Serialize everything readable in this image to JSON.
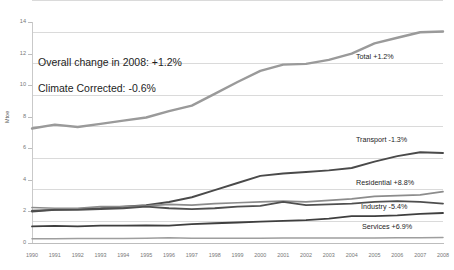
{
  "title_fragment": "g",
  "annotations": [
    {
      "id": "overall-change",
      "text": "Overall change in 2008: +1.2%"
    },
    {
      "id": "climate-corrected",
      "text": "Climate Corrected: -0.6%"
    }
  ],
  "chart_data": {
    "type": "line",
    "title": "",
    "xlabel": "",
    "ylabel": "Mtoe",
    "ylim": [
      0,
      14
    ],
    "yticks": [
      0,
      2,
      4,
      6,
      8,
      10,
      12,
      14
    ],
    "grid": true,
    "legend_position": "right-inline-labels",
    "x": [
      1990,
      1991,
      1992,
      1993,
      1994,
      1995,
      1996,
      1997,
      1998,
      1999,
      2000,
      2001,
      2002,
      2003,
      2004,
      2005,
      2006,
      2007,
      2008
    ],
    "categories": [
      "1990",
      "1991",
      "1992",
      "1993",
      "1994",
      "1995",
      "1996",
      "1997",
      "1998",
      "1999",
      "2000",
      "2001",
      "2002",
      "2003",
      "2004",
      "2005",
      "2006",
      "2007",
      "2008"
    ],
    "series": [
      {
        "name": "Total",
        "label": "Total +1.2%",
        "change": "+1.2%",
        "color": "#9a9a9a",
        "width": 2.4,
        "values": [
          7.25,
          7.5,
          7.35,
          7.55,
          7.75,
          7.95,
          8.35,
          8.7,
          9.45,
          10.2,
          10.9,
          11.3,
          11.35,
          11.6,
          12.0,
          12.65,
          13.0,
          13.35,
          13.4
        ]
      },
      {
        "name": "Transport",
        "label": "Transport -1.3%",
        "change": "-1.3%",
        "color": "#4a4a4a",
        "width": 1.9,
        "values": [
          2.0,
          2.1,
          2.15,
          2.2,
          2.3,
          2.4,
          2.6,
          2.9,
          3.35,
          3.8,
          4.25,
          4.4,
          4.5,
          4.6,
          4.75,
          5.15,
          5.5,
          5.75,
          5.7
        ]
      },
      {
        "name": "Residential",
        "label": "Residential +8.8%",
        "change": "+8.8%",
        "color": "#8c8c8c",
        "width": 1.7,
        "values": [
          2.25,
          2.2,
          2.2,
          2.3,
          2.3,
          2.35,
          2.45,
          2.4,
          2.5,
          2.55,
          2.6,
          2.65,
          2.6,
          2.7,
          2.8,
          2.95,
          3.0,
          3.05,
          3.25
        ]
      },
      {
        "name": "Industry",
        "label": "Industry -5.4%",
        "change": "-5.4%",
        "color": "#4f4f4f",
        "width": 1.8,
        "values": [
          2.05,
          2.1,
          2.1,
          2.15,
          2.2,
          2.3,
          2.2,
          2.15,
          2.2,
          2.3,
          2.35,
          2.6,
          2.4,
          2.45,
          2.5,
          2.6,
          2.65,
          2.6,
          2.5
        ]
      },
      {
        "name": "Services",
        "label": "Services +6.9%",
        "change": "+6.9%",
        "color": "#3f3f3f",
        "width": 1.8,
        "values": [
          1.05,
          1.08,
          1.05,
          1.1,
          1.1,
          1.12,
          1.1,
          1.2,
          1.25,
          1.3,
          1.35,
          1.4,
          1.45,
          1.55,
          1.7,
          1.7,
          1.75,
          1.85,
          1.9
        ]
      },
      {
        "name": "Other",
        "label": "",
        "change": "",
        "color": "#9e9e9e",
        "width": 1.5,
        "values": [
          0.27,
          0.27,
          0.28,
          0.28,
          0.29,
          0.3,
          0.33,
          0.3,
          0.3,
          0.3,
          0.3,
          0.31,
          0.31,
          0.32,
          0.32,
          0.32,
          0.33,
          0.33,
          0.35
        ]
      }
    ]
  }
}
